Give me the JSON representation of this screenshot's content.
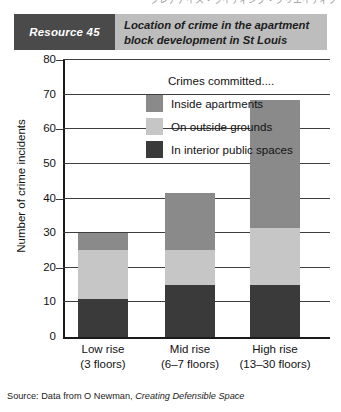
{
  "top_sliver": {
    "text": "クレアアイス・ライティング・クリエイティブ"
  },
  "banner": {
    "badge": "Resource 45",
    "title": "Location of crime in the apartment block development in St Louis",
    "badge_bg": "#4a4a4a",
    "banner_bg": "#bdbdbd"
  },
  "source": {
    "prefix": "Source: Data from O Newman,",
    "book": "Creating Defensible Space"
  },
  "chart_data": {
    "type": "bar",
    "stacked": true,
    "title": "Location of crime in the apartment block development in St Louis",
    "xlabel": "",
    "ylabel": "Number of crime incidents",
    "ylim": [
      0,
      80
    ],
    "ytick_step": 10,
    "yticks": [
      0,
      10,
      20,
      30,
      40,
      50,
      60,
      70,
      80
    ],
    "grid": true,
    "legend_title": "Crimes committed....",
    "legend_position": "upper-left-inside",
    "categories": [
      "Low rise",
      "Mid rise",
      "High rise"
    ],
    "category_sublabels": [
      "(3 floors)",
      "(6–7 floors)",
      "(13–30 floors)"
    ],
    "series": [
      {
        "name": "In interior public spaces",
        "color": "#3a3a3a",
        "values": [
          11,
          15,
          15
        ]
      },
      {
        "name": "On outside grounds",
        "color": "#c6c6c6",
        "values": [
          14,
          10,
          16.5
        ]
      },
      {
        "name": "Inside apartments",
        "color": "#8a8a8a",
        "values": [
          5,
          16.5,
          37
        ]
      }
    ],
    "totals": [
      30,
      41.5,
      68.5
    ]
  }
}
